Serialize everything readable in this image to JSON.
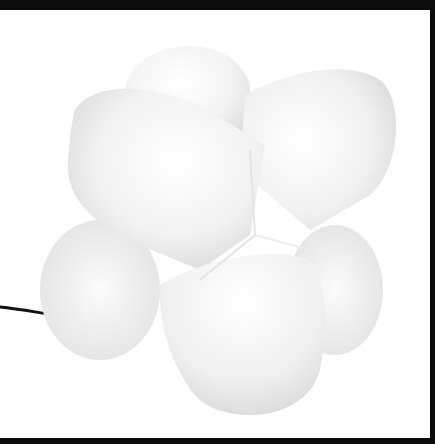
{
  "image": {
    "subject": "white lobed sculptural lamp with black power cord",
    "background_color": "#ffffff",
    "border_color": "#0b0b0b",
    "cord_color": "#111111"
  }
}
